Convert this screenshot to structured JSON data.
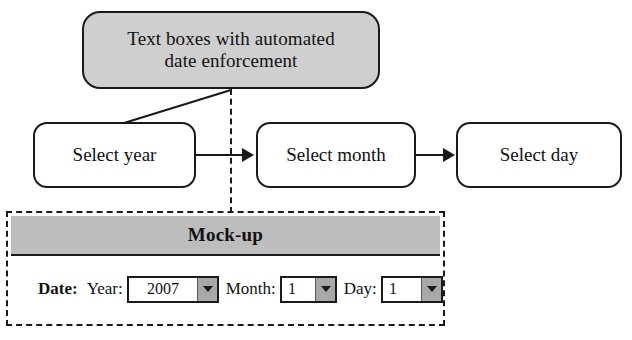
{
  "callout": {
    "line1": "Text boxes with automated",
    "line2": "date enforcement"
  },
  "flow": {
    "steps": [
      {
        "label": "Select year"
      },
      {
        "label": "Select month"
      },
      {
        "label": "Select day"
      }
    ]
  },
  "mockup": {
    "title": "Mock-up",
    "date_label": "Date:",
    "fields": [
      {
        "label": "Year:",
        "value": "2007"
      },
      {
        "label": "Month:",
        "value": "1"
      },
      {
        "label": "Day:",
        "value": "1"
      }
    ]
  },
  "colors": {
    "callout_fill": "#cfcfcf",
    "header_fill": "#bdbdbd",
    "dropdown_button": "#a8a8a8",
    "stroke": "#1a1a1a",
    "page_bg": "#ffffff"
  },
  "icons": {
    "caret": "chevron-down-icon",
    "arrow": "arrow-right-icon"
  }
}
